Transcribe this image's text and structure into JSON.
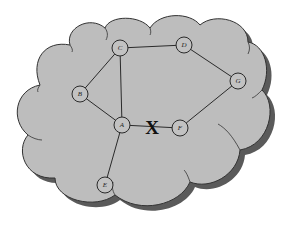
{
  "diagram": {
    "colors": {
      "cloud_fill": "#bdbdbd",
      "cloud_shadow": "#5a5a5a",
      "line": "#2a2a2a",
      "background": "#ffffff"
    },
    "nodes": [
      {
        "id": "A",
        "label": "A"
      },
      {
        "id": "B",
        "label": "B"
      },
      {
        "id": "C",
        "label": "C"
      },
      {
        "id": "D",
        "label": "D"
      },
      {
        "id": "E",
        "label": "E"
      },
      {
        "id": "F",
        "label": "F"
      },
      {
        "id": "G",
        "label": "G"
      }
    ],
    "edges": [
      {
        "from": "C",
        "to": "D",
        "status": "up"
      },
      {
        "from": "C",
        "to": "B",
        "status": "up"
      },
      {
        "from": "C",
        "to": "A",
        "status": "up"
      },
      {
        "from": "B",
        "to": "A",
        "status": "up"
      },
      {
        "from": "D",
        "to": "G",
        "status": "up"
      },
      {
        "from": "G",
        "to": "F",
        "status": "up"
      },
      {
        "from": "A",
        "to": "F",
        "status": "broken"
      },
      {
        "from": "A",
        "to": "E",
        "status": "up"
      }
    ],
    "break_marker": {
      "label": "X",
      "edge": "A-F"
    }
  }
}
